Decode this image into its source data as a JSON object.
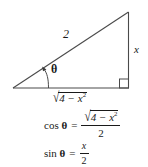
{
  "figure": {
    "stroke_color": "#4a4a4a",
    "text_color": "#1a1a1a",
    "background_color": "#ffffff"
  },
  "triangle": {
    "hypotenuse_label": "2",
    "opposite_label": "x",
    "adjacent_label": {
      "radical_sign": "√",
      "radicand_base": "4 − x",
      "radicand_exponent": "2"
    },
    "angle_label": "θ",
    "right_angle_marker": "right-angle-square",
    "vertices": {
      "left": [
        13,
        88
      ],
      "bottom_right": [
        128,
        88
      ],
      "apex": [
        128,
        12
      ]
    }
  },
  "equations": {
    "cosine": {
      "function": "cos",
      "angle": "θ",
      "equals": "=",
      "numerator": {
        "radical_sign": "√",
        "radicand_base": "4 − x",
        "radicand_exponent": "2"
      },
      "denominator": "2"
    },
    "sine": {
      "function": "sin",
      "angle": "θ",
      "equals": "=",
      "numerator": "x",
      "denominator": "2"
    }
  }
}
